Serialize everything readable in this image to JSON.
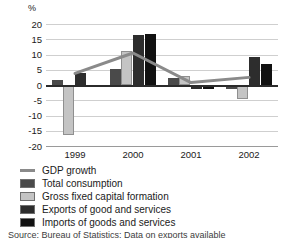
{
  "chart_data": {
    "type": "bar",
    "title": "",
    "subtitle": "",
    "xlabel": "",
    "ylabel": "%",
    "categories": [
      "1999",
      "2000",
      "2001",
      "2002"
    ],
    "ylim": [
      -20,
      20
    ],
    "y_ticks": [
      20,
      15,
      10,
      5,
      0,
      -5,
      -10,
      -15,
      -20
    ],
    "y_tick_labels": [
      "20",
      "15",
      "10",
      "5",
      "0",
      "-5",
      "-10",
      "-15",
      "-20"
    ],
    "grid": true,
    "legend_position": "below",
    "series": [
      {
        "name": "GDP growth",
        "type": "line",
        "color": "#8a8a8a",
        "values": [
          3.8,
          10.5,
          0.8,
          2.5
        ]
      },
      {
        "name": "Total consumption",
        "type": "bar",
        "color": "#4a4a4a",
        "values": [
          1.7,
          5.3,
          2.2,
          -1.2
        ]
      },
      {
        "name": "Gross fixed capital formation",
        "type": "bar",
        "color": "#c4c4c4",
        "values": [
          -16.5,
          11.0,
          2.8,
          -4.5
        ]
      },
      {
        "name": "Exports of good and services",
        "type": "bar",
        "color": "#2d2d2d",
        "values": [
          3.9,
          16.5,
          -1.3,
          9.3
        ]
      },
      {
        "name": "Imports of goods and services",
        "type": "bar",
        "color": "#111111",
        "values": [
          -0.3,
          16.8,
          -1.4,
          6.9
        ]
      }
    ]
  },
  "legend": {
    "items": [
      {
        "label": "GDP growth",
        "marker": "line",
        "color": "#8a8a8a"
      },
      {
        "label": "Total consumption",
        "marker": "swatch",
        "color": "#4a4a4a"
      },
      {
        "label": "Gross fixed capital formation",
        "marker": "swatch",
        "color": "#c4c4c4"
      },
      {
        "label": "Exports of good and services",
        "marker": "swatch",
        "color": "#2d2d2d"
      },
      {
        "label": "Imports of goods and services",
        "marker": "swatch",
        "color": "#111111"
      }
    ]
  },
  "source_note": "Source: Bureau of Statistics; Data on exports available"
}
